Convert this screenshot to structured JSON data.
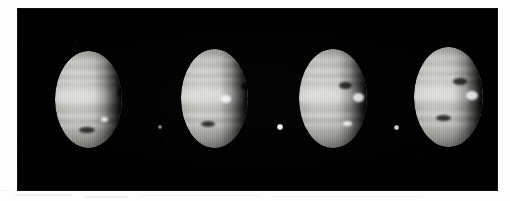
{
  "image": {
    "kind": "astronomical-photographic-plate",
    "subject": "Jupiter",
    "caption": "",
    "frame_count": 4,
    "background_color": "#000000",
    "page_color": "#fdfdfd",
    "plate": {
      "x": 18,
      "y": 9,
      "width": 479,
      "height": 181
    }
  },
  "frames": [
    {
      "index": 1,
      "label": "frame-1",
      "planet": {
        "name": "jupiter-disk-1",
        "x": 55,
        "y": 51,
        "width": 67,
        "height": 97,
        "illumination": "gibbous",
        "terminator_side": "right"
      },
      "moon": null,
      "markings": [
        {
          "name": "dark-spot",
          "type": "dark",
          "x": 62,
          "y": 38,
          "w": 13,
          "h": 8
        },
        {
          "name": "dark-belt-patch",
          "type": "dark",
          "x": 24,
          "y": 76,
          "w": 16,
          "h": 6
        },
        {
          "name": "bright-zone-knot",
          "type": "bright",
          "x": 46,
          "y": 66,
          "w": 7,
          "h": 5
        }
      ]
    },
    {
      "index": 2,
      "label": "frame-2",
      "planet": {
        "name": "jupiter-disk-2",
        "x": 181,
        "y": 49,
        "width": 67,
        "height": 99,
        "illumination": "gibbous",
        "terminator_side": "right"
      },
      "moon": {
        "name": "moon-1",
        "x": 158,
        "y": 125,
        "size": 4,
        "brightness": "faint"
      },
      "markings": [
        {
          "name": "dark-spot",
          "type": "dark",
          "x": 60,
          "y": 34,
          "w": 12,
          "h": 7
        },
        {
          "name": "bright-flash",
          "type": "bright",
          "x": 40,
          "y": 46,
          "w": 10,
          "h": 8
        },
        {
          "name": "dark-belt-patch",
          "type": "dark",
          "x": 20,
          "y": 72,
          "w": 14,
          "h": 6
        }
      ]
    },
    {
      "index": 3,
      "label": "frame-3",
      "planet": {
        "name": "jupiter-disk-3",
        "x": 299,
        "y": 49,
        "width": 68,
        "height": 99,
        "illumination": "gibbous",
        "terminator_side": "right"
      },
      "moon": {
        "name": "moon-2",
        "x": 277,
        "y": 124,
        "size": 6,
        "brightness": "bright"
      },
      "markings": [
        {
          "name": "dark-spot",
          "type": "dark",
          "x": 40,
          "y": 33,
          "w": 13,
          "h": 7
        },
        {
          "name": "bright-flash",
          "type": "bright",
          "x": 54,
          "y": 44,
          "w": 11,
          "h": 9
        },
        {
          "name": "bright-knot-south",
          "type": "bright",
          "x": 44,
          "y": 72,
          "w": 9,
          "h": 5
        }
      ]
    },
    {
      "index": 4,
      "label": "frame-4",
      "planet": {
        "name": "jupiter-disk-4",
        "x": 414,
        "y": 47,
        "width": 69,
        "height": 100,
        "illumination": "gibbous",
        "terminator_side": "right"
      },
      "moon": {
        "name": "moon-3",
        "x": 394,
        "y": 125,
        "size": 5,
        "brightness": "medium"
      },
      "markings": [
        {
          "name": "dark-spot",
          "type": "dark",
          "x": 39,
          "y": 31,
          "w": 14,
          "h": 7
        },
        {
          "name": "bright-flash",
          "type": "bright",
          "x": 52,
          "y": 44,
          "w": 12,
          "h": 9
        },
        {
          "name": "dark-belt-patch",
          "type": "dark",
          "x": 22,
          "y": 68,
          "w": 15,
          "h": 6
        }
      ]
    }
  ],
  "artifacts": {
    "scan_marks": [
      {
        "name": "scan-mark-1"
      },
      {
        "name": "scan-mark-2"
      },
      {
        "name": "scan-mark-3"
      },
      {
        "name": "scan-mark-4"
      },
      {
        "name": "scan-mark-5"
      }
    ]
  }
}
